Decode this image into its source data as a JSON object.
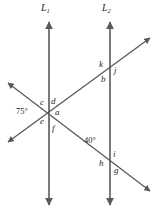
{
  "figure": {
    "background": "#ffffff",
    "stroke_color": "#58595b",
    "label_color": "#231f20",
    "width": 158,
    "height": 217
  },
  "lines": {
    "l1": {
      "label": "L",
      "subscript": "1",
      "x": 49,
      "top_y": 22,
      "bottom_y": 205,
      "orientation": "vertical",
      "arrow_top": true,
      "arrow_bottom": true
    },
    "l2": {
      "label": "L",
      "subscript": "2",
      "x": 110,
      "top_y": 22,
      "bottom_y": 205,
      "orientation": "vertical",
      "arrow_top": true,
      "arrow_bottom": true
    },
    "transversal_rising": {
      "name": "transversal-up-right",
      "from_x": 8,
      "from_y": 142,
      "to_x": 150,
      "to_y": 38,
      "arrow_start": true,
      "arrow_end": true
    },
    "transversal_falling": {
      "name": "transversal-down-right",
      "from_x": 8,
      "from_y": 83,
      "to_x": 150,
      "to_y": 191,
      "arrow_start": true,
      "arrow_end": true
    }
  },
  "angle_labels": [
    {
      "id": "deg75",
      "text": "75°",
      "x": 16,
      "y": 107,
      "kind": "measure",
      "at": "l1-intersection-left"
    },
    {
      "id": "c",
      "text": "c",
      "x": 40,
      "y": 98,
      "kind": "variable",
      "at": "l1-intersection-upper-left"
    },
    {
      "id": "d",
      "text": "d",
      "x": 51,
      "y": 97,
      "kind": "variable",
      "at": "l1-intersection-upper-right"
    },
    {
      "id": "a",
      "text": "a",
      "x": 55,
      "y": 108,
      "kind": "variable",
      "at": "l1-intersection-right"
    },
    {
      "id": "e",
      "text": "e",
      "x": 40,
      "y": 117,
      "kind": "variable",
      "at": "l1-intersection-lower-left"
    },
    {
      "id": "f",
      "text": "f",
      "x": 52,
      "y": 124,
      "kind": "variable",
      "at": "l1-intersection-lower-right"
    },
    {
      "id": "k",
      "text": "k",
      "x": 99,
      "y": 60,
      "kind": "variable",
      "at": "l2-upper-intersection-upper-left"
    },
    {
      "id": "j",
      "text": "j",
      "x": 114,
      "y": 66,
      "kind": "variable",
      "at": "l2-upper-intersection-right"
    },
    {
      "id": "b",
      "text": "b",
      "x": 101,
      "y": 75,
      "kind": "variable",
      "at": "l2-upper-intersection-lower-left"
    },
    {
      "id": "deg40",
      "text": "40°",
      "x": 84,
      "y": 136,
      "kind": "measure",
      "at": "l2-lower-intersection-upper-left"
    },
    {
      "id": "i",
      "text": "i",
      "x": 113,
      "y": 150,
      "kind": "variable",
      "at": "l2-lower-intersection-upper-right"
    },
    {
      "id": "h",
      "text": "h",
      "x": 99,
      "y": 159,
      "kind": "variable",
      "at": "l2-lower-intersection-lower-left"
    },
    {
      "id": "g",
      "text": "g",
      "x": 114,
      "y": 166,
      "kind": "variable",
      "at": "l2-lower-intersection-lower-right"
    }
  ],
  "line_labels": [
    {
      "id": "L1",
      "base": "L",
      "sub": "1",
      "x": 41,
      "y": 3
    },
    {
      "id": "L2",
      "base": "L",
      "sub": "2",
      "x": 102,
      "y": 3
    }
  ]
}
